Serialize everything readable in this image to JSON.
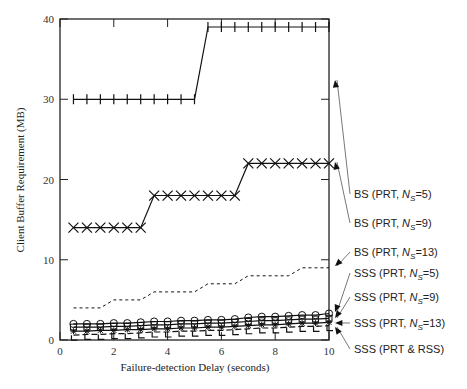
{
  "chart_data": {
    "type": "line",
    "title": "",
    "xlabel": "Failure-detection Delay (seconds)",
    "ylabel": "Client Buffer Requirement (MB)",
    "xlim": [
      0,
      10
    ],
    "ylim": [
      0,
      40
    ],
    "xticks": [
      0,
      2,
      4,
      6,
      8,
      10
    ],
    "yticks": [
      0,
      10,
      20,
      30,
      40
    ],
    "grid": false,
    "legend_position": "right, with leader arrows",
    "x": [
      0.5,
      1.0,
      1.5,
      2.0,
      2.5,
      3.0,
      3.5,
      4.0,
      4.5,
      5.0,
      5.5,
      6.0,
      6.5,
      7.0,
      7.5,
      8.0,
      8.5,
      9.0,
      9.5,
      10.0
    ],
    "series": [
      {
        "name": "BS (PRT, N_S=5)",
        "marker": "plus",
        "style": "solid",
        "values": [
          30,
          30,
          30,
          30,
          30,
          30,
          30,
          30,
          30,
          30,
          39,
          39,
          39,
          39,
          39,
          39,
          39,
          39,
          39,
          39
        ]
      },
      {
        "name": "BS (PRT, N_S=9)",
        "marker": "x",
        "style": "solid",
        "values": [
          14,
          14,
          14,
          14,
          14,
          14,
          18,
          18,
          18,
          18,
          18,
          18,
          18,
          22,
          22,
          22,
          22,
          22,
          22,
          22
        ]
      },
      {
        "name": "BS (PRT, N_S=13)",
        "marker": "none",
        "style": "dotted",
        "values": [
          4,
          4,
          4,
          5,
          5,
          5,
          6,
          6,
          6,
          6,
          7,
          7,
          7,
          8,
          8,
          8,
          8,
          9,
          9,
          9
        ]
      },
      {
        "name": "SSS (PRT, N_S=5)",
        "marker": "circle",
        "style": "solid",
        "values": [
          2.0,
          2.0,
          2.0,
          2.1,
          2.1,
          2.2,
          2.3,
          2.3,
          2.4,
          2.4,
          2.5,
          2.5,
          2.6,
          2.8,
          2.9,
          2.9,
          3.0,
          3.1,
          3.1,
          3.3
        ]
      },
      {
        "name": "SSS (PRT, N_S=9)",
        "marker": "square",
        "style": "solid",
        "values": [
          1.6,
          1.6,
          1.6,
          1.7,
          1.7,
          1.8,
          1.9,
          1.9,
          2.0,
          2.0,
          2.1,
          2.1,
          2.2,
          2.3,
          2.4,
          2.4,
          2.5,
          2.6,
          2.6,
          2.7
        ]
      },
      {
        "name": "SSS (PRT, N_S=13)",
        "marker": "asterisk",
        "style": "solid",
        "values": [
          1.1,
          1.1,
          1.2,
          1.2,
          1.3,
          1.3,
          1.4,
          1.4,
          1.5,
          1.5,
          1.6,
          1.6,
          1.7,
          1.8,
          1.9,
          1.9,
          2.0,
          2.1,
          2.1,
          2.2
        ]
      },
      {
        "name": "SSS (PRT & RSS)",
        "marker": "dash",
        "style": "dashed",
        "values": [
          0.6,
          0.7,
          0.7,
          0.8,
          0.8,
          0.9,
          1.0,
          1.0,
          1.1,
          1.1,
          1.2,
          1.2,
          1.3,
          1.4,
          1.5,
          1.5,
          1.6,
          1.7,
          1.7,
          1.8
        ]
      }
    ],
    "legend": [
      {
        "prefix": "BS (PRT, ",
        "ns": "N",
        "sub": "S",
        "suffix": "=5)",
        "label_y": 198,
        "arrow_to_y": 80
      },
      {
        "prefix": "BS (PRT, ",
        "ns": "N",
        "sub": "S",
        "suffix": "=9)",
        "label_y": 227,
        "arrow_to_y": 162
      },
      {
        "prefix": "BS (PRT, ",
        "ns": "N",
        "sub": "S",
        "suffix": "=13)",
        "label_y": 256,
        "arrow_to_y": 266
      },
      {
        "prefix": "SSS (PRT, ",
        "ns": "N",
        "sub": "S",
        "suffix": "=5)",
        "label_y": 277,
        "arrow_to_y": 312
      },
      {
        "prefix": "SSS (PRT, ",
        "ns": "N",
        "sub": "S",
        "suffix": "=9)",
        "label_y": 301,
        "arrow_to_y": 318
      },
      {
        "prefix": "SSS (PRT, ",
        "ns": "N",
        "sub": "S",
        "suffix": "=13)",
        "label_y": 327,
        "arrow_to_y": 323
      },
      {
        "prefix": "SSS (PRT & RSS)",
        "ns": "",
        "sub": "",
        "suffix": "",
        "label_y": 353,
        "arrow_to_y": 327
      }
    ]
  }
}
